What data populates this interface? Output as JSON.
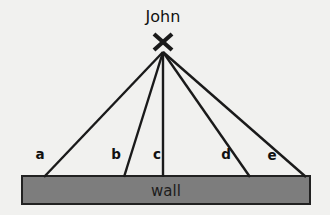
{
  "diagram": {
    "title_text": "John",
    "observer": {
      "name": "John",
      "marker": "x-marker",
      "x": 163,
      "y": 52,
      "label_x": 163,
      "label_y": 22
    },
    "wall": {
      "label": "wall",
      "x": 22,
      "y": 176,
      "width": 288,
      "height": 28,
      "fill_color": "#7d7d7d",
      "border_color": "#212121",
      "label_x": 166,
      "label_y": 196
    },
    "background_color": "#f1f1ef",
    "line_color": "#1a1a1a",
    "rays": [
      {
        "label": "a",
        "start_x": 163,
        "start_y": 52,
        "end_x": 44,
        "end_y": 177,
        "label_x": 40,
        "label_y": 159
      },
      {
        "label": "b",
        "start_x": 163,
        "start_y": 52,
        "end_x": 124,
        "end_y": 177,
        "label_x": 116,
        "label_y": 159
      },
      {
        "label": "c",
        "start_x": 163,
        "start_y": 52,
        "end_x": 163,
        "end_y": 177,
        "label_x": 157,
        "label_y": 159
      },
      {
        "label": "d",
        "start_x": 163,
        "start_y": 52,
        "end_x": 250,
        "end_y": 177,
        "label_x": 226,
        "label_y": 159
      },
      {
        "label": "e",
        "start_x": 163,
        "start_y": 52,
        "end_x": 306,
        "end_y": 177,
        "label_x": 272,
        "label_y": 160
      }
    ],
    "marker_segments": [
      {
        "x1": 154,
        "y1": 34,
        "x2": 172,
        "y2": 50
      },
      {
        "x1": 172,
        "y1": 34,
        "x2": 154,
        "y2": 50
      }
    ]
  }
}
